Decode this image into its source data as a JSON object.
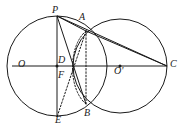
{
  "figure": {
    "stroke_color": "#1a1a1a",
    "label_color": "#1a1a1a",
    "background_color": "#ffffff",
    "points": {
      "P": {
        "label": "P",
        "x": 57,
        "y": 16
      },
      "A": {
        "label": "A",
        "x": 86,
        "y": 31
      },
      "O": {
        "label": "O",
        "x": 57,
        "y": 66
      },
      "D": {
        "label": "D",
        "x": 64,
        "y": 63
      },
      "F": {
        "label": "F",
        "x": 62,
        "y": 75
      },
      "Oprime": {
        "label": "O'",
        "x": 120,
        "y": 66
      },
      "C": {
        "label": "C",
        "x": 167,
        "y": 66
      },
      "B": {
        "label": "B",
        "x": 86,
        "y": 104
      },
      "E": {
        "label": "E",
        "x": 57,
        "y": 117
      }
    },
    "circles": [
      {
        "name": "circle-O",
        "center_x": 57,
        "center_y": 66,
        "radius": 50
      },
      {
        "name": "circle-O-prime",
        "center_x": 120,
        "center_y": 66,
        "radius": 47
      }
    ],
    "solid_segments": [
      {
        "name": "segment-PE",
        "x1": 57,
        "y1": 16,
        "x2": 57,
        "y2": 117
      },
      {
        "name": "segment-PC",
        "x1": 57,
        "y1": 16,
        "x2": 167,
        "y2": 66
      },
      {
        "name": "segment-PB",
        "x1": 57,
        "y1": 16,
        "x2": 86,
        "y2": 104
      },
      {
        "name": "segment-PA",
        "x1": 57,
        "y1": 16,
        "x2": 86,
        "y2": 31
      },
      {
        "name": "segment-AC",
        "x1": 86,
        "y1": 31,
        "x2": 167,
        "y2": 66
      },
      {
        "name": "segment-OC",
        "x1": 12,
        "y1": 66,
        "x2": 167,
        "y2": 66
      }
    ],
    "dotted_segments": [
      {
        "name": "segment-AB-dotted",
        "x1": 86,
        "y1": 31,
        "x2": 86,
        "y2": 104
      },
      {
        "name": "segment-AE-dotted",
        "x1": 86,
        "y1": 31,
        "x2": 57,
        "y2": 117
      }
    ],
    "dotted_arcs": [
      {
        "name": "arc-AB-left-dotted",
        "path": "M 86 31 C 68 46 68 89 86 104"
      }
    ]
  }
}
